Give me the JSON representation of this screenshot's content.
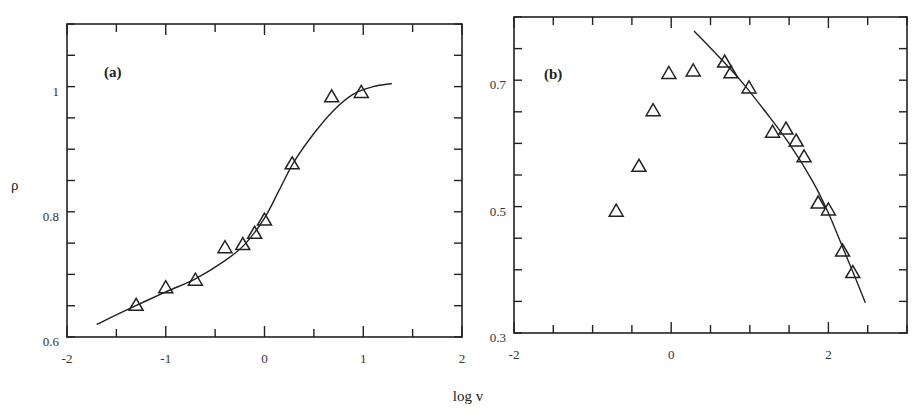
{
  "figure": {
    "shared_xlabel": "log v",
    "ylabel": "ρ"
  },
  "chart_data": [
    {
      "type": "scatter",
      "panel": "(a)",
      "title": "",
      "xlabel": "log v",
      "ylabel": "ρ",
      "xlim": [
        -2,
        2
      ],
      "ylim": [
        0.6,
        1.1
      ],
      "xticks": [
        -2,
        -1,
        0,
        1,
        2
      ],
      "xtick_labels": [
        "-2",
        "-1",
        "0",
        "1",
        "2"
      ],
      "yticks": [
        0.6,
        0.8,
        1.0
      ],
      "ytick_labels": [
        "0.6",
        "0.8",
        "1"
      ],
      "grid": false,
      "legend": null,
      "series": [
        {
          "name": "data",
          "marker": "open-triangle",
          "x": [
            -1.3,
            -1.0,
            -0.7,
            -0.4,
            -0.22,
            -0.1,
            0.0,
            0.28,
            0.68,
            0.98
          ],
          "y": [
            0.65,
            0.678,
            0.69,
            0.742,
            0.747,
            0.765,
            0.786,
            0.876,
            0.983,
            0.99
          ]
        },
        {
          "name": "fit",
          "line": "solid",
          "x": [
            -1.7,
            -1.4,
            -1.0,
            -0.7,
            -0.4,
            -0.2,
            0.0,
            0.15,
            0.3,
            0.5,
            0.7,
            0.9,
            1.1,
            1.29
          ],
          "y": [
            0.62,
            0.643,
            0.672,
            0.693,
            0.722,
            0.748,
            0.79,
            0.835,
            0.88,
            0.925,
            0.962,
            0.988,
            1.0,
            1.005
          ]
        }
      ]
    },
    {
      "type": "scatter",
      "panel": "(b)",
      "title": "",
      "xlabel": "log v",
      "ylabel": "ρ",
      "xlim": [
        -2,
        3
      ],
      "ylim": [
        0.3,
        0.8
      ],
      "xticks": [
        -2,
        0,
        2
      ],
      "xtick_labels": [
        "-2",
        "0",
        "2"
      ],
      "yticks": [
        0.3,
        0.5,
        0.7
      ],
      "ytick_labels": [
        "0.3",
        "0.5",
        "0.7"
      ],
      "grid": false,
      "legend": null,
      "series": [
        {
          "name": "data",
          "marker": "open-triangle",
          "x": [
            -0.7,
            -0.41,
            -0.23,
            -0.03,
            0.28,
            0.68,
            0.76,
            0.99,
            1.29,
            1.46,
            1.59,
            1.69,
            1.87,
            2.0,
            2.18,
            2.31
          ],
          "y": [
            0.492,
            0.563,
            0.651,
            0.71,
            0.714,
            0.728,
            0.711,
            0.687,
            0.617,
            0.622,
            0.603,
            0.578,
            0.505,
            0.494,
            0.429,
            0.395
          ]
        },
        {
          "name": "fit",
          "line": "solid",
          "x": [
            0.29,
            0.6,
            0.9,
            1.2,
            1.5,
            1.8,
            2.0,
            2.2,
            2.35,
            2.47
          ],
          "y": [
            0.778,
            0.738,
            0.697,
            0.65,
            0.6,
            0.54,
            0.49,
            0.43,
            0.385,
            0.348
          ]
        }
      ]
    }
  ]
}
